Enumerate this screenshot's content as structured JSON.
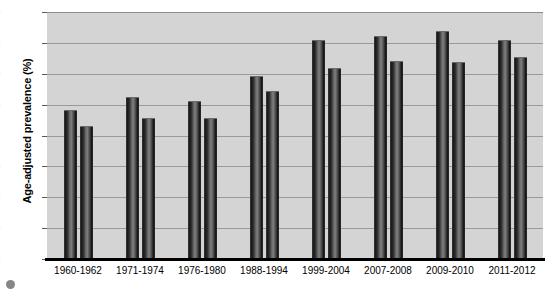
{
  "chart_data": {
    "type": "bar",
    "title": "",
    "xlabel": "",
    "ylabel": "Age-adjusted prevalence (%)",
    "ylim": [
      0,
      80
    ],
    "yticks": [
      0,
      10,
      20,
      30,
      40,
      50,
      60,
      70,
      80
    ],
    "ytick_labels": [
      "0",
      "10",
      "20",
      "30",
      "40",
      "50",
      "60",
      "70",
      "80"
    ],
    "grid": true,
    "legend": "none",
    "categories": [
      "1960-1962",
      "1971-1974",
      "1976-1980",
      "1988-1994",
      "1999-2004",
      "2007-2008",
      "2009-2010",
      "2011-2012"
    ],
    "series": [
      {
        "name": "Series 1",
        "values": [
          48.2,
          52.6,
          51.3,
          59.4,
          70.8,
          72.3,
          74.0,
          71.0
        ]
      },
      {
        "name": "Series 2",
        "values": [
          43.0,
          45.8,
          45.8,
          54.5,
          62.0,
          64.1,
          63.9,
          65.5
        ]
      }
    ]
  },
  "axis": {
    "y_title": "Age-adjusted prevalence (%)"
  },
  "marks": {
    "page_mark": ""
  }
}
